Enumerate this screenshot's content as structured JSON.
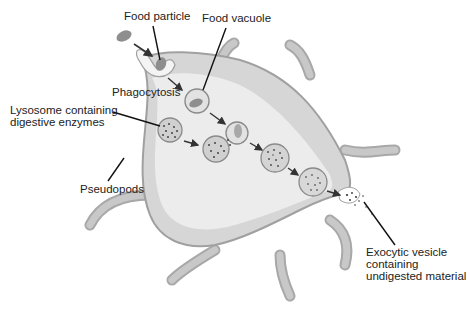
{
  "diagram": {
    "colors": {
      "cell_fill": "#d9d9d9",
      "cell_inner": "#eeeeee",
      "cell_edge": "#a8a8a8",
      "pseudopod": "#bdbdbd",
      "organelle_fill": "#cfcfcf",
      "particle": "#8c8c8c",
      "dots": "#444444",
      "leader": "#111111"
    },
    "labels": {
      "food_particle": "Food particle",
      "food_vacuole": "Food vacuole",
      "phagocytosis": "Phagocytosis",
      "lysosome_line1": "Lysosome containing",
      "lysosome_line2": "digestive enzymes",
      "pseudopods": "Pseudopods",
      "exocytic_line1": "Exocytic vesicle",
      "exocytic_line2": "containing",
      "exocytic_line3": "undigested material"
    }
  }
}
